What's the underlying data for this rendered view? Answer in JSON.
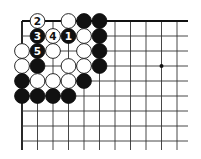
{
  "diagram": {
    "type": "go-board-corner",
    "grid": {
      "origin_x": 22,
      "origin_y": 21,
      "spacing_x": 15.5,
      "spacing_y": 15,
      "columns": 11,
      "rows": 9,
      "right_extent": 188,
      "bottom_extent": 150
    },
    "star_points": [
      {
        "col": 9,
        "row": 3
      }
    ],
    "stones": [
      {
        "col": 1,
        "row": 0,
        "color": "white",
        "label": "2"
      },
      {
        "col": 3,
        "row": 0,
        "color": "white",
        "label": ""
      },
      {
        "col": 4,
        "row": 0,
        "color": "black",
        "label": ""
      },
      {
        "col": 5,
        "row": 0,
        "color": "black",
        "label": ""
      },
      {
        "col": 1,
        "row": 1,
        "color": "black",
        "label": "3"
      },
      {
        "col": 2,
        "row": 1,
        "color": "white",
        "label": "4"
      },
      {
        "col": 3,
        "row": 1,
        "color": "black",
        "label": "1"
      },
      {
        "col": 4,
        "row": 1,
        "color": "white",
        "label": ""
      },
      {
        "col": 5,
        "row": 1,
        "color": "black",
        "label": ""
      },
      {
        "col": 0,
        "row": 2,
        "color": "white",
        "label": ""
      },
      {
        "col": 1,
        "row": 2,
        "color": "black",
        "label": "5"
      },
      {
        "col": 2,
        "row": 2,
        "color": "white",
        "label": ""
      },
      {
        "col": 4,
        "row": 2,
        "color": "white",
        "label": ""
      },
      {
        "col": 5,
        "row": 2,
        "color": "black",
        "label": ""
      },
      {
        "col": 0,
        "row": 3,
        "color": "white",
        "label": ""
      },
      {
        "col": 1,
        "row": 3,
        "color": "black",
        "label": ""
      },
      {
        "col": 3,
        "row": 3,
        "color": "white",
        "label": ""
      },
      {
        "col": 4,
        "row": 3,
        "color": "white",
        "label": ""
      },
      {
        "col": 5,
        "row": 3,
        "color": "black",
        "label": ""
      },
      {
        "col": 0,
        "row": 4,
        "color": "black",
        "label": ""
      },
      {
        "col": 1,
        "row": 4,
        "color": "white",
        "label": ""
      },
      {
        "col": 2,
        "row": 4,
        "color": "white",
        "label": ""
      },
      {
        "col": 3,
        "row": 4,
        "color": "white",
        "label": ""
      },
      {
        "col": 4,
        "row": 4,
        "color": "black",
        "label": ""
      },
      {
        "col": 0,
        "row": 5,
        "color": "black",
        "label": ""
      },
      {
        "col": 1,
        "row": 5,
        "color": "black",
        "label": ""
      },
      {
        "col": 2,
        "row": 5,
        "color": "black",
        "label": ""
      },
      {
        "col": 3,
        "row": 5,
        "color": "black",
        "label": ""
      }
    ],
    "colors": {
      "line": "#333333",
      "edge": "#111111",
      "black_stone": "#111111",
      "white_stone": "#ffffff",
      "background": "#ffffff"
    }
  }
}
